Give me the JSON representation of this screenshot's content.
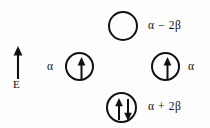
{
  "diagram": {
    "kind": "molecular-orbital-energy-level-diagram",
    "width": 210,
    "height": 128,
    "background_color": "#fdfdfd",
    "ink_color": "#111111"
  },
  "axis": {
    "label": "E",
    "icon": "up-arrow-icon",
    "direction": "up"
  },
  "levels": [
    {
      "id": "antibonding",
      "energy_label": "α − 2β",
      "label_side": "right",
      "electrons": 0,
      "spins": [],
      "occupancy": "empty"
    },
    {
      "id": "nonbonding-left",
      "energy_label": "α",
      "label_side": "left",
      "electrons": 1,
      "spins": [
        "up"
      ],
      "occupancy": "singly-occupied"
    },
    {
      "id": "nonbonding-right",
      "energy_label": "α",
      "label_side": "right",
      "electrons": 1,
      "spins": [
        "up"
      ],
      "occupancy": "singly-occupied"
    },
    {
      "id": "bonding",
      "energy_label": "α + 2β",
      "label_side": "right",
      "electrons": 2,
      "spins": [
        "up",
        "down"
      ],
      "occupancy": "doubly-occupied"
    }
  ]
}
